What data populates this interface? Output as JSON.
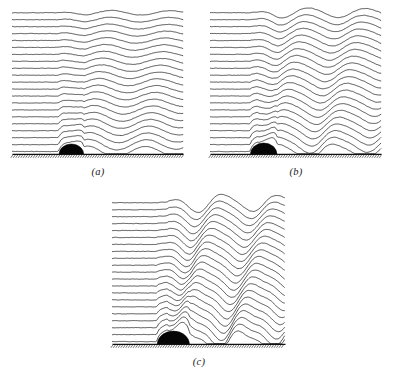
{
  "figure": {
    "background_color": "#ffffff",
    "line_color": "#2b2b2b",
    "obstacle_color": "#050505",
    "ground_color": "#111111",
    "panel_count": 3
  },
  "panels": [
    {
      "id": "panel-a",
      "label": "(a)",
      "position": {
        "left": 8,
        "top": 8,
        "width": 180,
        "height": 154
      },
      "label_top": 166,
      "streamline_count": 21,
      "streamline_spacing": 7.3,
      "obstacle": {
        "center_x": 62,
        "radius_x": 13,
        "radius_y": 11
      },
      "ground_y": 154,
      "wave": {
        "amplitude": 6.5,
        "wavelength": 62,
        "phase_tilt": 0.62,
        "decay": 0.18,
        "onset_x": 62,
        "amplitude_growth": 1.0
      }
    },
    {
      "id": "panel-b",
      "label": "(b)",
      "position": {
        "left": 206,
        "top": 8,
        "width": 180,
        "height": 154
      },
      "label_top": 166,
      "streamline_count": 21,
      "streamline_spacing": 7.3,
      "obstacle": {
        "center_x": 56,
        "radius_x": 14,
        "radius_y": 12
      },
      "ground_y": 154,
      "wave": {
        "amplitude": 9.5,
        "wavelength": 60,
        "phase_tilt": 0.78,
        "decay": 0.13,
        "onset_x": 56,
        "amplitude_growth": 1.35
      }
    },
    {
      "id": "panel-c",
      "label": "(c)",
      "position": {
        "left": 108,
        "top": 198,
        "width": 182,
        "height": 154
      },
      "label_top": 356,
      "streamline_count": 21,
      "streamline_spacing": 7.3,
      "obstacle": {
        "center_x": 64,
        "radius_x": 17,
        "radius_y": 14
      },
      "ground_y": 154,
      "wave": {
        "amplitude": 12.5,
        "wavelength": 58,
        "phase_tilt": 0.95,
        "decay": 0.09,
        "onset_x": 64,
        "amplitude_growth": 1.7
      }
    }
  ],
  "chart_data": {
    "type": "line",
    "title": "",
    "xlabel": "",
    "ylabel": "",
    "series": [
      {
        "name": "(a) weak forcing",
        "streamlines": 21,
        "wave_amplitude": 6.5,
        "wavelength": 62,
        "overturning": false
      },
      {
        "name": "(b) moderate forcing",
        "streamlines": 21,
        "wave_amplitude": 9.5,
        "wavelength": 60,
        "overturning": false
      },
      {
        "name": "(c) strong forcing",
        "streamlines": 21,
        "wave_amplitude": 12.5,
        "wavelength": 58,
        "overturning": true
      }
    ]
  }
}
